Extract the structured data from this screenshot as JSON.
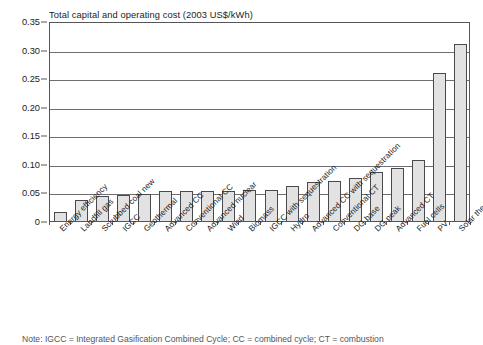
{
  "chart_data": {
    "type": "bar",
    "title": "Total capital and operating cost (2003 US$/kWh)",
    "xlabel": "",
    "ylabel": "",
    "ylim": [
      0,
      0.35
    ],
    "ytick_labels": [
      "0.35",
      "0.30",
      "0.25",
      "0.20",
      "0.15",
      "0.10",
      "0.05",
      "0"
    ],
    "ytick_values": [
      0.35,
      0.3,
      0.25,
      0.2,
      0.15,
      0.1,
      0.05,
      0
    ],
    "grid": "horizontal",
    "legend": "none",
    "categories": [
      "Energy efficiency",
      "Landfill gas",
      "Scrubbed coal new",
      "IGCC",
      "Geothermal",
      "Advanced CC",
      "Conventional CC",
      "Advanced nuclear",
      "Wind",
      "Biomass",
      "IGCC with sequestration",
      "Hydro",
      "Advanced CC with sequestration",
      "Conventional CT",
      "DG base",
      "DG peak",
      "Advanced CT",
      "Fuel cells",
      "PV",
      "Solar thermal"
    ],
    "values": [
      0.015,
      0.037,
      0.044,
      0.045,
      0.048,
      0.052,
      0.052,
      0.053,
      0.053,
      0.054,
      0.055,
      0.062,
      0.069,
      0.07,
      0.075,
      0.085,
      0.093,
      0.107,
      0.259,
      0.31
    ],
    "bar_color": "#e2e2e2",
    "bar_edge_color": "#4a4a4e"
  },
  "note": {
    "text": "Note: IGCC = Integrated Gasification Combined Cycle; CC = combined cycle; CT = combustion"
  }
}
